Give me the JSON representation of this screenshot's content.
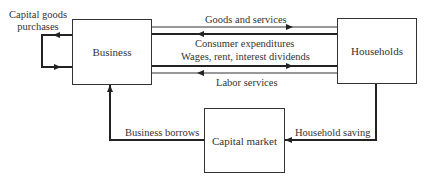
{
  "nodes": {
    "business": {
      "label": "Business"
    },
    "households": {
      "label": "Households"
    },
    "capital_market": {
      "label": "Capital market"
    }
  },
  "flows": {
    "capital_goods": {
      "label_line1": "Capital goods",
      "label_line2": "purchases"
    },
    "goods_services": {
      "label": "Goods and services"
    },
    "consumer_expenditures": {
      "label": "Consumer expenditures"
    },
    "wages": {
      "label": "Wages, rent, interest dividends"
    },
    "labor_services": {
      "label": "Labor services"
    },
    "business_borrows": {
      "label": "Business borrows"
    },
    "household_saving": {
      "label": "Household saving"
    }
  },
  "colors": {
    "line": "#333333",
    "thick_line": "#222222",
    "text": "#333333"
  }
}
